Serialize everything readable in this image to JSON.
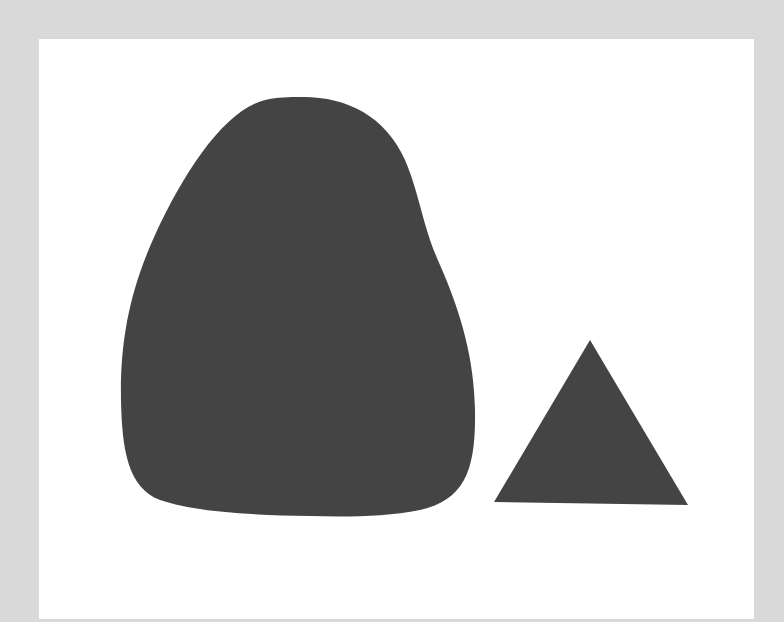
{
  "scene": {
    "description": "Two dark gray silhouettes on a white card: a large rounded pear-shaped blob and a smaller equilateral triangle",
    "colors": {
      "background": "#d9d9d9",
      "panel": "#ffffff",
      "shape_fill": "#444444"
    },
    "shapes": [
      {
        "kind": "blob",
        "label": "rounded blob"
      },
      {
        "kind": "triangle",
        "label": "triangle"
      }
    ]
  }
}
